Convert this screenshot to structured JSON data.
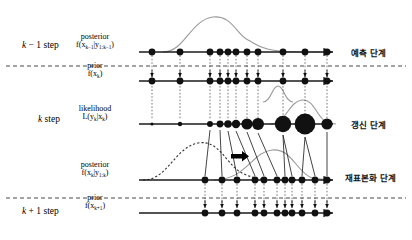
{
  "figure": {
    "type": "particle-filter-sequence-diagram",
    "background": "#ffffff",
    "width": 412,
    "height": 240
  },
  "steps": [
    {
      "id": "k-minus-1",
      "text": "k − 1 step",
      "x": 22,
      "y": 40
    },
    {
      "id": "k",
      "text": "k step",
      "x": 38,
      "y": 114
    },
    {
      "id": "k-plus-1",
      "text": "k + 1 step",
      "x": 22,
      "y": 206
    }
  ],
  "rows": [
    {
      "id": "posterior-km1",
      "name": "posterior",
      "formula": "f(x k−1 | y 1:k−1)",
      "formula_parts": {
        "head": "f(x",
        "sub1": "k−1",
        "mid": "|y",
        "sub2": "1:k−1",
        "tail": ")"
      },
      "axis_y": 52,
      "label_x": 94,
      "label_y": 36
    },
    {
      "id": "prior-k",
      "name": "prior",
      "formula": "f(x k)",
      "formula_parts": {
        "head": "f(x",
        "sub1": "k",
        "mid": "",
        "sub2": "",
        "tail": ")"
      },
      "axis_y": 81,
      "label_x": 94,
      "label_y": 65
    },
    {
      "id": "likelihood-k",
      "name": "likelihood",
      "formula": "L(y k | x k)",
      "formula_parts": {
        "head": "L(y",
        "sub1": "k",
        "mid": "|x",
        "sub2": "k",
        "tail": ")"
      },
      "axis_y": 124,
      "label_x": 94,
      "label_y": 108
    },
    {
      "id": "posterior-k",
      "name": "posterior",
      "formula": "f(x k | y 1:k)",
      "formula_parts": {
        "head": "f(x",
        "sub1": "k",
        "mid": "|y",
        "sub2": "1:k",
        "tail": ")"
      },
      "axis_y": 180,
      "label_x": 94,
      "label_y": 164
    },
    {
      "id": "prior-kp1",
      "name": "prior",
      "formula": "f(x k+1)",
      "formula_parts": {
        "head": "f(x",
        "sub1": "k+1",
        "mid": "",
        "sub2": "",
        "tail": ")"
      },
      "axis_y": 213,
      "label_x": 94,
      "label_y": 197
    }
  ],
  "phases": [
    {
      "id": "prediction",
      "text": "예측 단계",
      "x": 351,
      "y": 52
    },
    {
      "id": "update",
      "text": "갱신 단계",
      "x": 351,
      "y": 124
    },
    {
      "id": "resampling",
      "text": "재표본화 단계",
      "x": 351,
      "y": 177
    }
  ],
  "dividers": [
    {
      "id": "divider-upper",
      "y": 66
    },
    {
      "id": "divider-lower",
      "y": 198
    }
  ],
  "axes": {
    "x_start": 139,
    "x_end": 336,
    "color": "#1a1a1a"
  },
  "particles": {
    "posterior_km1_x": [
      152,
      180,
      210,
      220,
      228,
      236,
      247,
      258,
      283,
      305,
      327
    ],
    "prior_k_x": [
      152,
      180,
      210,
      220,
      228,
      236,
      247,
      258,
      283,
      305,
      327
    ],
    "likelihood_x": [
      152,
      180,
      210,
      220,
      228,
      236,
      247,
      258,
      283,
      305,
      327
    ],
    "likelihood_radius": [
      1.6,
      2.2,
      3.0,
      3.4,
      3.8,
      4.2,
      5.6,
      6.0,
      8.2,
      10.4,
      5.6
    ],
    "posterior_k_x": [
      205,
      222,
      237,
      255,
      264,
      277,
      285,
      292,
      302,
      315,
      327
    ],
    "prior_kp1_x": [
      205,
      222,
      237,
      255,
      264,
      277,
      285,
      292,
      302,
      315,
      327
    ],
    "uniform_radius": 3.4,
    "color": "#111111"
  },
  "curves": {
    "prediction_density": {
      "id": "prediction-density-curve",
      "color": "#9a9a9a",
      "style": "solid"
    },
    "prior_density": {
      "id": "prior-density-curve",
      "color": "#9a9a9a",
      "style": "solid"
    },
    "likelihood_density": {
      "id": "likelihood-density-curve",
      "color": "#9a9a9a",
      "style": "solid"
    },
    "posterior_density_dashed": {
      "id": "posterior-density-dashed-curve",
      "color": "#333333",
      "style": "dashed"
    },
    "resampled_density": {
      "id": "resampled-density-curve",
      "color": "#9a9a9a",
      "style": "solid"
    }
  },
  "resample_arrow": {
    "id": "resample-arrow",
    "x": 238,
    "y": 156,
    "color": "#000000"
  }
}
